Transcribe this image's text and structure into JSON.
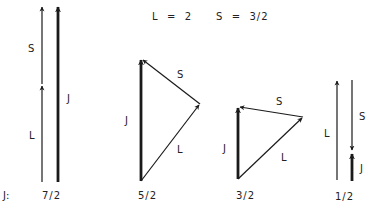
{
  "header": {
    "l_equation": "L  =  2",
    "s_equation": "S  =  3/2"
  },
  "row_label": "J:",
  "diagrams": [
    {
      "id": "j-7-2",
      "j_value": "7/2",
      "labels": {
        "s": "S",
        "l": "L",
        "j": "J"
      }
    },
    {
      "id": "j-5-2",
      "j_value": "5/2",
      "labels": {
        "s": "S",
        "l": "L",
        "j": "J"
      }
    },
    {
      "id": "j-3-2",
      "j_value": "3/2",
      "labels": {
        "s": "S",
        "l": "L",
        "j": "J"
      }
    },
    {
      "id": "j-1-2",
      "j_value": "1/2",
      "labels": {
        "s": "S",
        "l": "L",
        "j": "J"
      }
    }
  ],
  "colors": {
    "stroke": "#1a1a1a",
    "background": "#ffffff"
  }
}
